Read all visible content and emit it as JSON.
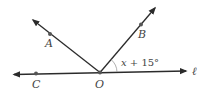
{
  "diagram": {
    "type": "geometry-angles",
    "colors": {
      "line": "#2b2b2b",
      "point": "#555555",
      "label": "#444444",
      "arc": "#9a9a9a"
    },
    "points": {
      "A": {
        "label": "A"
      },
      "B": {
        "label": "B"
      },
      "C": {
        "label": "C"
      },
      "O": {
        "label": "O"
      }
    },
    "line": {
      "label": "ℓ"
    },
    "angle": {
      "label": "x + 15°",
      "between": [
        "OB",
        "ℓ"
      ]
    }
  }
}
